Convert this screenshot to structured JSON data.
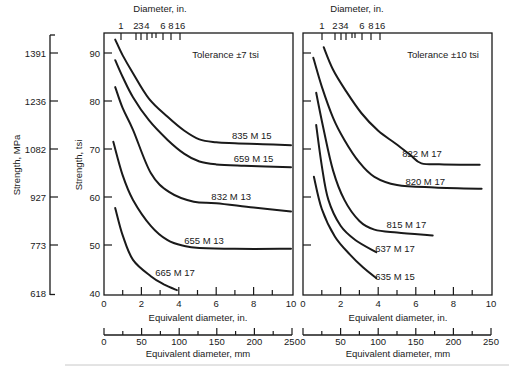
{
  "figure": {
    "mpa_axis_title": "Strength, MPa",
    "tsi_axis_title": "Strength, tsi",
    "top_axis_title": "Diameter, in.",
    "bottom_in_axis_title": "Equivalent diameter, in.",
    "bottom_mm_axis_title": "Equivalent diameter, mm"
  },
  "chart_data": [
    {
      "type": "line",
      "title": "Tolerance ±7 tsi",
      "xlabel": "Equivalent diameter, in.",
      "x2label": "Equivalent diameter, mm",
      "top_xlabel": "Diameter, in.",
      "ylabel": "Strength, tsi",
      "y2label": "Strength, MPa",
      "xlim": [
        0,
        10
      ],
      "ylim": [
        40,
        95
      ],
      "x_ticks": [
        0,
        2,
        4,
        6,
        8,
        10
      ],
      "y_ticks": [
        40,
        50,
        60,
        70,
        80,
        90
      ],
      "mm_ticks": [
        0,
        50,
        100,
        150,
        200,
        250
      ],
      "mpa_ticks": [
        618,
        773,
        927,
        1082,
        1236,
        1391
      ],
      "top_ticks": [
        "1",
        "2",
        "3",
        "4",
        "6",
        "8",
        "16"
      ],
      "grid": false,
      "title_pos": [
        6.5,
        89.6
      ],
      "series": [
        {
          "name": "835 M 15",
          "label_pos": [
            7.9,
            72.9
          ],
          "points": [
            [
              0.6,
              92.8
            ],
            [
              1.0,
              89.5
            ],
            [
              1.55,
              85.8
            ],
            [
              2.4,
              80.5
            ],
            [
              3.4,
              76.7
            ],
            [
              4.3,
              73.8
            ],
            [
              5.1,
              72.0
            ],
            [
              6.0,
              71.4
            ],
            [
              7.0,
              71.2
            ],
            [
              8.5,
              71.0
            ],
            [
              10,
              70.8
            ]
          ]
        },
        {
          "name": "659 M 15",
          "label_pos": [
            8.0,
            68.1
          ],
          "points": [
            [
              0.6,
              88.5
            ],
            [
              1.0,
              85.0
            ],
            [
              1.55,
              80.8
            ],
            [
              2.4,
              76.0
            ],
            [
              3.4,
              71.9
            ],
            [
              4.3,
              69.0
            ],
            [
              5.1,
              67.4
            ],
            [
              6.0,
              66.8
            ],
            [
              7.5,
              66.5
            ],
            [
              10,
              66.2
            ]
          ]
        },
        {
          "name": "832 M 13",
          "label_pos": [
            6.8,
            60.2
          ],
          "points": [
            [
              0.6,
              82.9
            ],
            [
              1.0,
              78.5
            ],
            [
              1.55,
              74.0
            ],
            [
              2.5,
              65.0
            ],
            [
              3.5,
              61.0
            ],
            [
              4.8,
              59.0
            ],
            [
              6.0,
              58.7
            ],
            [
              8.0,
              57.8
            ],
            [
              10,
              57.0
            ]
          ]
        },
        {
          "name": "655 M 13",
          "label_pos": [
            5.35,
            51.0
          ],
          "points": [
            [
              0.5,
              71.5
            ],
            [
              1.0,
              64.5
            ],
            [
              1.55,
              59.4
            ],
            [
              2.5,
              54.0
            ],
            [
              3.4,
              51.0
            ],
            [
              4.3,
              49.8
            ],
            [
              5.1,
              49.4
            ],
            [
              7.0,
              49.2
            ],
            [
              10,
              49.2
            ]
          ]
        },
        {
          "name": "665 M 17",
          "label_pos": [
            3.8,
            44.2
          ],
          "points": [
            [
              0.6,
              57.7
            ],
            [
              1.0,
              52.0
            ],
            [
              1.55,
              46.9
            ],
            [
              2.5,
              43.5
            ],
            [
              3.2,
              41.8
            ],
            [
              3.9,
              40.6
            ]
          ]
        }
      ]
    },
    {
      "type": "line",
      "title": "Tolerance ±10 tsi",
      "xlabel": "Equivalent diameter, in.",
      "x2label": "Equivalent diameter, mm",
      "top_xlabel": "Diameter, in.",
      "ylabel": "Strength, tsi",
      "xlim": [
        0,
        10
      ],
      "ylim": [
        40,
        95
      ],
      "x_ticks": [
        0,
        2,
        4,
        6,
        8,
        10
      ],
      "y_ticks": [
        40,
        50,
        60,
        70,
        80,
        90
      ],
      "mm_ticks": [
        0,
        50,
        100,
        150,
        200,
        250
      ],
      "top_ticks": [
        "1",
        "2",
        "3",
        "4",
        "6",
        "8",
        "16"
      ],
      "grid": false,
      "title_pos": [
        7.45,
        89.6
      ],
      "series": [
        {
          "name": "822 M 17",
          "label_pos": [
            6.33,
            69.0
          ],
          "points": [
            [
              1.1,
              91.2
            ],
            [
              1.6,
              86.5
            ],
            [
              2.3,
              82.0
            ],
            [
              3.1,
              77.5
            ],
            [
              4.0,
              73.8
            ],
            [
              4.9,
              71.2
            ],
            [
              5.7,
              68.8
            ],
            [
              6.3,
              67.0
            ],
            [
              7.5,
              66.8
            ],
            [
              9.4,
              66.7
            ]
          ]
        },
        {
          "name": "820 M 17",
          "label_pos": [
            6.5,
            63.3
          ],
          "points": [
            [
              0.55,
              89.0
            ],
            [
              1.0,
              83.0
            ],
            [
              1.6,
              76.5
            ],
            [
              2.2,
              71.9
            ],
            [
              3.0,
              67.2
            ],
            [
              3.8,
              64.2
            ],
            [
              5.0,
              62.5
            ],
            [
              7.0,
              62.0
            ],
            [
              9.5,
              61.7
            ]
          ]
        },
        {
          "name": "815 M 17",
          "label_pos": [
            5.5,
            54.2
          ],
          "points": [
            [
              0.7,
              81.7
            ],
            [
              1.1,
              74.0
            ],
            [
              1.6,
              65.5
            ],
            [
              2.2,
              59.4
            ],
            [
              3.0,
              55.0
            ],
            [
              3.8,
              53.2
            ],
            [
              5.0,
              52.6
            ],
            [
              6.9,
              52.0
            ]
          ]
        },
        {
          "name": "637 M 17",
          "label_pos": [
            4.9,
            49.2
          ],
          "points": [
            [
              0.7,
              75.0
            ],
            [
              1.0,
              66.5
            ],
            [
              1.35,
              59.4
            ],
            [
              2.0,
              54.0
            ],
            [
              2.8,
              51.0
            ],
            [
              3.9,
              48.5
            ]
          ]
        },
        {
          "name": "635 M 15",
          "label_pos": [
            4.9,
            43.5
          ],
          "points": [
            [
              0.58,
              64.2
            ],
            [
              1.0,
              57.5
            ],
            [
              1.7,
              51.7
            ],
            [
              2.5,
              48.0
            ],
            [
              3.2,
              45.3
            ],
            [
              3.9,
              43.1
            ]
          ]
        }
      ]
    }
  ]
}
